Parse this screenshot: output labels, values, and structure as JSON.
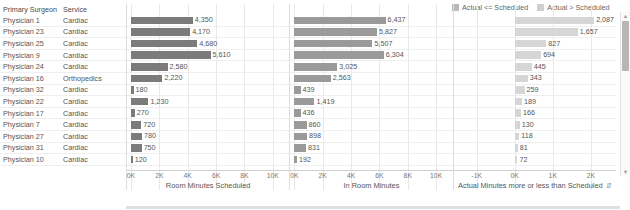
{
  "legend": {
    "items": [
      {
        "label": "Actual <= Scheduled",
        "color": "#b8b8b8"
      },
      {
        "label": "Actual > Scheduled",
        "color": "#cfcfcf"
      }
    ]
  },
  "table": {
    "headers": [
      "Primary Surgeon",
      "Service"
    ],
    "rows": [
      {
        "surgeon": "Physician 1",
        "service": "Cardiac"
      },
      {
        "surgeon": "Physician 23",
        "service": "Cardiac"
      },
      {
        "surgeon": "Physician 25",
        "service": "Cardiac"
      },
      {
        "surgeon": "Physician 9",
        "service": "Cardiac"
      },
      {
        "surgeon": "Physician 24",
        "service": "Cardiac"
      },
      {
        "surgeon": "Physician 16",
        "service": "Orthopedics"
      },
      {
        "surgeon": "Physician 32",
        "service": "Cardiac"
      },
      {
        "surgeon": "Physician 22",
        "service": "Cardiac"
      },
      {
        "surgeon": "Physician 17",
        "service": "Cardiac"
      },
      {
        "surgeon": "Physician 7",
        "service": "Cardiac"
      },
      {
        "surgeon": "Physician 27",
        "service": "Cardiac"
      },
      {
        "surgeon": "Physician 31",
        "service": "Cardiac"
      },
      {
        "surgeon": "Physician 10",
        "service": "Cardiac"
      }
    ]
  },
  "scrollbar": {
    "up_arrow": "▲",
    "down_arrow": "▼"
  },
  "chart_data": [
    {
      "type": "bar",
      "orientation": "horizontal",
      "title": "Room Minutes Scheduled",
      "xlabel": "Room Minutes Scheduled",
      "ylabel": "",
      "xlim": [
        0,
        11000
      ],
      "ticks": [
        "0K",
        "2K",
        "4K",
        "6K",
        "8K",
        "10K"
      ],
      "tick_values": [
        0,
        2000,
        4000,
        6000,
        8000,
        10000
      ],
      "grid": true,
      "categories": [
        "Physician 1",
        "Physician 23",
        "Physician 25",
        "Physician 9",
        "Physician 24",
        "Physician 16",
        "Physician 32",
        "Physician 22",
        "Physician 17",
        "Physician 7",
        "Physician 27",
        "Physician 31",
        "Physician 10"
      ],
      "values": [
        4350,
        4170,
        4680,
        5610,
        2580,
        2220,
        180,
        1230,
        270,
        720,
        780,
        750,
        120
      ],
      "labels": [
        "4,350",
        "4,170",
        "4,680",
        "5,610",
        "2,580",
        "2,220",
        "180",
        "1,230",
        "270",
        "720",
        "780",
        "750",
        "120"
      ],
      "color": "#7b7b7b"
    },
    {
      "type": "bar",
      "orientation": "horizontal",
      "title": "In Room Minutes",
      "xlabel": "In Room Minutes",
      "ylabel": "",
      "xlim": [
        0,
        11000
      ],
      "ticks": [
        "0K",
        "2K",
        "4K",
        "6K",
        "8K",
        "10K"
      ],
      "tick_values": [
        0,
        2000,
        4000,
        6000,
        8000,
        10000
      ],
      "grid": true,
      "categories": [
        "Physician 1",
        "Physician 23",
        "Physician 25",
        "Physician 9",
        "Physician 24",
        "Physician 16",
        "Physician 32",
        "Physician 22",
        "Physician 17",
        "Physician 7",
        "Physician 27",
        "Physician 31",
        "Physician 10"
      ],
      "values": [
        6437,
        5827,
        5507,
        6304,
        3025,
        2563,
        439,
        1419,
        436,
        860,
        898,
        831,
        192
      ],
      "labels": [
        "6,437",
        "5,827",
        "5,507",
        "6,304",
        "3,025",
        "2,563",
        "439",
        "1,419",
        "436",
        "860",
        "898",
        "831",
        "192"
      ],
      "color": "#9a9a9a"
    },
    {
      "type": "bar",
      "orientation": "horizontal",
      "title": "Actual Minutes more or less than Scheduled",
      "xlabel": "Actual Minutes more or less than Scheduled",
      "ylabel": "",
      "xlim": [
        -1500,
        2600
      ],
      "ticks": [
        "-1K",
        "0K",
        "1K",
        "2K"
      ],
      "tick_values": [
        -1000,
        0,
        1000,
        2000
      ],
      "grid": true,
      "categories": [
        "Physician 1",
        "Physician 23",
        "Physician 25",
        "Physician 9",
        "Physician 24",
        "Physician 16",
        "Physician 32",
        "Physician 22",
        "Physician 17",
        "Physician 7",
        "Physician 27",
        "Physician 31",
        "Physician 10"
      ],
      "values": [
        2087,
        1657,
        827,
        694,
        445,
        343,
        259,
        189,
        166,
        130,
        118,
        81,
        72
      ],
      "labels": [
        "2,087",
        "1,657",
        "827",
        "694",
        "445",
        "343",
        "259",
        "189",
        "166",
        "130",
        "118",
        "81",
        "72"
      ],
      "color": "#d6d6d6",
      "sort_icon": "⇵"
    }
  ]
}
